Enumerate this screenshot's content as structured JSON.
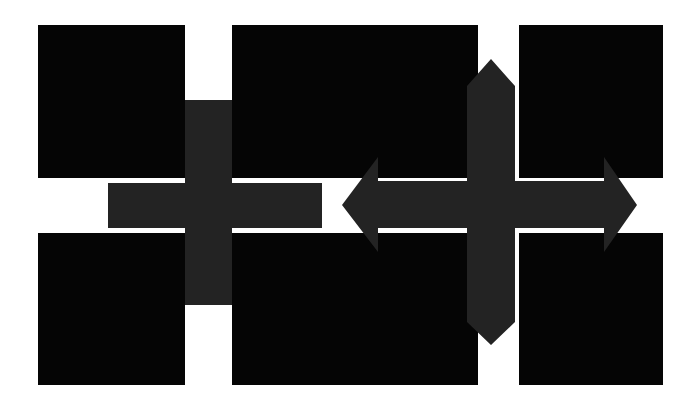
{
  "artwork": {
    "title": "Abstract Geometric Composition",
    "background_color": "#ffffff",
    "canvas": {
      "width": 695,
      "height": 405
    },
    "palette": {
      "background": "#ffffff",
      "square_black": "#050505",
      "cross_dark_gray": "#232323"
    }
  },
  "shapes": {
    "squares": [
      {
        "name": "square-top-left",
        "x": 38,
        "y": 25,
        "width": 147,
        "height": 153,
        "color": "#050505"
      },
      {
        "name": "square-top-center",
        "x": 232,
        "y": 25,
        "width": 246,
        "height": 153,
        "color": "#050505"
      },
      {
        "name": "square-top-right",
        "x": 519,
        "y": 25,
        "width": 144,
        "height": 153,
        "color": "#050505"
      },
      {
        "name": "square-bottom-left",
        "x": 38,
        "y": 233,
        "width": 147,
        "height": 152,
        "color": "#050505"
      },
      {
        "name": "square-bottom-center",
        "x": 232,
        "y": 233,
        "width": 246,
        "height": 152,
        "color": "#050505"
      },
      {
        "name": "square-bottom-right",
        "x": 519,
        "y": 233,
        "width": 144,
        "height": 152,
        "color": "#050505"
      }
    ],
    "crosses": [
      {
        "name": "plus-cross-flat",
        "style": "flat-ends",
        "color": "#232323",
        "center_x": 208,
        "center_y": 205,
        "arm_thickness": 46,
        "horizontal_extent": [
          108,
          322
        ],
        "vertical_extent": [
          100,
          305
        ],
        "points": "185,100 232,100 232,183 322,183 322,228 232,228 232,305 185,305 185,228 108,228 108,183 185,183"
      },
      {
        "name": "arrow-cross-pointed",
        "style": "pointed-arrowheads",
        "color": "#232323",
        "center_x": 491,
        "center_y": 205,
        "arm_thickness": 48,
        "horizontal_extent": [
          342,
          637
        ],
        "vertical_extent": [
          59,
          345
        ],
        "arrowhead_length": 33,
        "points": "491,59 515,86 515,181 604,181 604,157 637,205 604,252 604,228 515,228 515,322 491,345 467,322 467,228 378,228 378,252 342,205 378,157 378,181 467,181 467,86"
      }
    ]
  }
}
